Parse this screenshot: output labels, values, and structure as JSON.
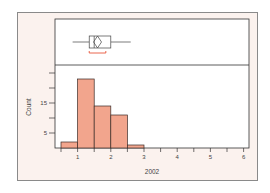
{
  "chart_data": {
    "type": "bar",
    "subtype": "histogram-with-boxplot",
    "title": "",
    "xlabel": "2002",
    "ylabel": "Count",
    "bins": [
      {
        "start": 0.5,
        "end": 1.0,
        "count": 2
      },
      {
        "start": 1.0,
        "end": 1.5,
        "count": 23
      },
      {
        "start": 1.5,
        "end": 2.0,
        "count": 14
      },
      {
        "start": 2.0,
        "end": 2.5,
        "count": 11
      },
      {
        "start": 2.5,
        "end": 3.0,
        "count": 1
      }
    ],
    "categories": [
      "0.5-1",
      "1-1.5",
      "1.5-2",
      "2-2.5",
      "2.5-3"
    ],
    "values": [
      2,
      23,
      14,
      11,
      1
    ],
    "x_ticks": [
      "1",
      "2",
      "3",
      "4",
      "5",
      "6"
    ],
    "y_ticks": [
      "5",
      "15"
    ],
    "xlim": [
      0.5,
      6
    ],
    "ylim": [
      0,
      27
    ],
    "boxplot": {
      "whisker_low": 0.85,
      "q1": 1.35,
      "median": 1.5,
      "mean": 1.6,
      "q3": 2.0,
      "whisker_high": 2.6,
      "shortest_half": [
        1.35,
        1.85
      ]
    },
    "grid": false,
    "legend": null
  },
  "colors": {
    "bar_fill": "#f2a58d",
    "bar_stroke": "#3a2a25",
    "frame_bg": "#fbf2ee",
    "plot_bg": "#ffffff",
    "shortest_half": "#e8553a"
  }
}
